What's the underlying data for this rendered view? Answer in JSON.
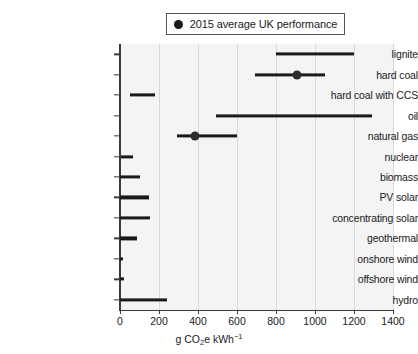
{
  "legend": {
    "marker": "circle-marker",
    "label": "2015 average UK performance"
  },
  "axis": {
    "xlabel_main": "g CO",
    "xlabel_sub": "2",
    "xlabel_mid": "e kWh",
    "xlabel_sup": "−1",
    "xlabel_full": "g CO2e kWh-1"
  },
  "chart_data": {
    "type": "bar",
    "orientation": "horizontal",
    "title": "",
    "subtitle": "",
    "xlabel": "g CO2e kWh-1",
    "ylabel": "",
    "xlim": [
      0,
      1400
    ],
    "ylim": [
      0,
      13
    ],
    "xticks": [
      0,
      200,
      400,
      600,
      800,
      1000,
      1200,
      1400
    ],
    "xticklabels": [
      "0",
      "200",
      "400",
      "600",
      "800",
      "1000",
      "1200",
      "1400"
    ],
    "grid": "vertical",
    "legend_position": "top-center",
    "legend_entries": [
      "2015 average UK performance"
    ],
    "categories": [
      "lignite",
      "hard coal",
      "hard coal with CCS",
      "oil",
      "natural gas",
      "nuclear",
      "biomass",
      "PV solar",
      "concentrating solar",
      "geothermal",
      "onshore wind",
      "offshore wind",
      "hydro"
    ],
    "ranges": [
      {
        "category": "lignite",
        "low": 800,
        "high": 1200,
        "marker": null
      },
      {
        "category": "hard coal",
        "low": 690,
        "high": 1050,
        "marker": 910
      },
      {
        "category": "hard coal with CCS",
        "low": 50,
        "high": 180,
        "marker": null
      },
      {
        "category": "oil",
        "low": 490,
        "high": 1290,
        "marker": null
      },
      {
        "category": "natural gas",
        "low": 290,
        "high": 600,
        "marker": 385
      },
      {
        "category": "nuclear",
        "low": 5,
        "high": 65,
        "marker": null
      },
      {
        "category": "biomass",
        "low": 0,
        "high": 100,
        "marker": null
      },
      {
        "category": "PV solar",
        "low": 0,
        "high": 150,
        "marker": null
      },
      {
        "category": "concentrating solar",
        "low": 0,
        "high": 155,
        "marker": null
      },
      {
        "category": "geothermal",
        "low": 0,
        "high": 85,
        "marker": null
      },
      {
        "category": "onshore wind",
        "low": 0,
        "high": 15,
        "marker": null
      },
      {
        "category": "offshore wind",
        "low": 0,
        "high": 18,
        "marker": null
      },
      {
        "category": "hydro",
        "low": 0,
        "high": 240,
        "marker": null
      }
    ]
  }
}
